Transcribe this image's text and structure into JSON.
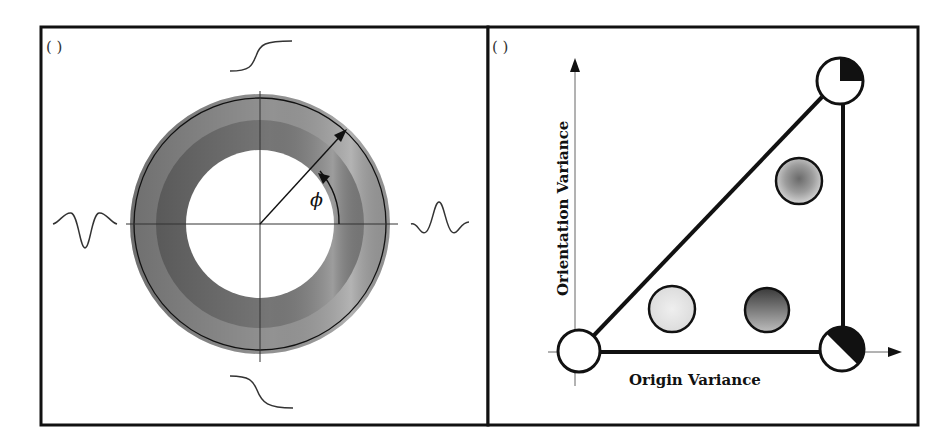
{
  "figure": {
    "panel_a": {
      "label": "( )",
      "angle_symbol": "ϕ",
      "description": "Annular (ring-shaped) pattern with cross-hair axes; Gaussian-derivative profile curves along horizontal axis and step (sigmoid) profile curves along vertical axis"
    },
    "panel_b": {
      "label": "( )",
      "x_axis_label": "Origin Variance",
      "y_axis_label": "Orientation Variance",
      "nodes": [
        {
          "id": "origin",
          "position": "bottom-left",
          "fill": "white"
        },
        {
          "id": "top-right",
          "position": "top-right",
          "fill": "white with black quarter sector"
        },
        {
          "id": "bottom-right",
          "position": "bottom-right",
          "fill": "white/black diagonal half"
        },
        {
          "id": "low-origin-low-orient",
          "position": "interior-left-bottom",
          "fill": "light gray stipple"
        },
        {
          "id": "high-origin-low-orient",
          "position": "interior-right-bottom",
          "fill": "dark gray gradient"
        },
        {
          "id": "high-origin-high-orient",
          "position": "interior-right-top",
          "fill": "radial gray blur"
        }
      ]
    }
  },
  "colors": {
    "frame": "#111111",
    "ring_outer": "#9a9a9a",
    "ring_inner": "#7d7d7d",
    "ring_highlight": "#c8c8c8",
    "line": "#111111",
    "axis_thin": "#666666"
  }
}
